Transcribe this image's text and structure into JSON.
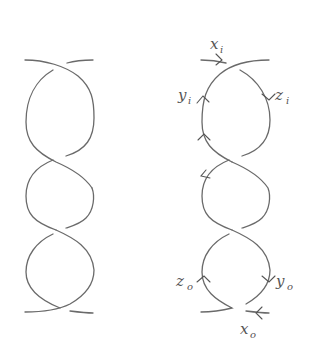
{
  "figure": {
    "background": "#ffffff",
    "stroke_color": "#6a6a6a",
    "label_color": "#555555",
    "panels": [
      {
        "id": "left",
        "description": "Unlabeled braid/tangle diagram with three stacked loops and four crossings",
        "crossings": 4,
        "labels": []
      },
      {
        "id": "right",
        "description": "Same tangle with orientation arrows and edge labels",
        "crossings": 4,
        "labels": [
          {
            "name": "x_i",
            "base": "x",
            "sub": "i",
            "position": "top, above incoming arrow"
          },
          {
            "name": "y_i",
            "base": "y",
            "sub": "i",
            "position": "upper-left"
          },
          {
            "name": "z_i",
            "base": "z",
            "sub": "i",
            "position": "upper-right"
          },
          {
            "name": "z_o",
            "base": "z",
            "sub": "o",
            "position": "lower-left"
          },
          {
            "name": "y_o",
            "base": "y",
            "sub": "o",
            "position": "lower-right"
          },
          {
            "name": "x_o",
            "base": "x",
            "sub": "o",
            "position": "bottom, below incoming arrow"
          }
        ],
        "arrows": [
          {
            "at": "top-left incoming strand",
            "direction": "right"
          },
          {
            "at": "upper loop left side",
            "direction": "up"
          },
          {
            "at": "upper loop right side",
            "direction": "down"
          },
          {
            "at": "upper loop lower-left",
            "direction": "up"
          },
          {
            "at": "middle loop left side",
            "direction": "left"
          },
          {
            "at": "lower loop left side",
            "direction": "up"
          },
          {
            "at": "lower loop right side",
            "direction": "down"
          },
          {
            "at": "bottom-right incoming strand",
            "direction": "left"
          }
        ]
      }
    ]
  }
}
